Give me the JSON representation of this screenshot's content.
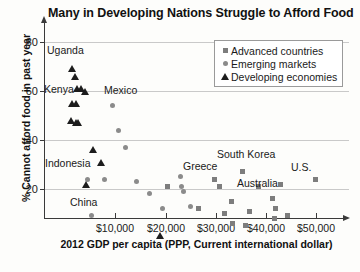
{
  "chart_data": {
    "type": "scatter",
    "title": "Many in Developing Nations Struggle to Afford Food",
    "xlabel": "2012 GDP per capita (PPP, Current international dollar)",
    "ylabel": "% Cannot afford food in past year",
    "xlim": [
      0,
      54000
    ],
    "ylim": [
      0,
      84
    ],
    "grid": true,
    "legend_position": "top-right",
    "xticks": [
      10000,
      20000,
      30000,
      40000,
      50000
    ],
    "xtick_labels": [
      "$10,000",
      "$20,000",
      "$30,000",
      "$40,000",
      "$50,000"
    ],
    "yticks": [
      20,
      40,
      60,
      80
    ],
    "ytick_labels": [
      "20",
      "40",
      "60",
      "80"
    ],
    "series": [
      {
        "name": "Advanced countries",
        "marker": "square",
        "color": "#7d7d7d",
        "points": [
          {
            "x": 20400,
            "y": 21
          },
          {
            "x": 26700,
            "y": 12
          },
          {
            "x": 29800,
            "y": 24
          },
          {
            "x": 30900,
            "y": 21
          },
          {
            "x": 31900,
            "y": 10
          },
          {
            "x": 33300,
            "y": 15
          },
          {
            "x": 33400,
            "y": 6
          },
          {
            "x": 35500,
            "y": 27
          },
          {
            "x": 36100,
            "y": 5
          },
          {
            "x": 36800,
            "y": 11
          },
          {
            "x": 38700,
            "y": 21
          },
          {
            "x": 41400,
            "y": 16
          },
          {
            "x": 41900,
            "y": 8
          },
          {
            "x": 42100,
            "y": 12
          },
          {
            "x": 43000,
            "y": 22
          },
          {
            "x": 44500,
            "y": 9
          },
          {
            "x": 50000,
            "y": 24
          }
        ]
      },
      {
        "name": "Emerging markets",
        "marker": "circle",
        "color": "#8b8b8b",
        "points": [
          {
            "x": 4500,
            "y": 24
          },
          {
            "x": 5200,
            "y": 9
          },
          {
            "x": 7800,
            "y": 24
          },
          {
            "x": 9400,
            "y": 54
          },
          {
            "x": 10600,
            "y": 44
          },
          {
            "x": 12100,
            "y": 37
          },
          {
            "x": 14300,
            "y": 23
          },
          {
            "x": 16800,
            "y": 18
          },
          {
            "x": 19400,
            "y": 12
          },
          {
            "x": 23100,
            "y": 25
          },
          {
            "x": 23300,
            "y": 21
          },
          {
            "x": 23600,
            "y": 19
          },
          {
            "x": 25100,
            "y": 13
          }
        ]
      },
      {
        "name": "Developing economies",
        "marker": "triangle",
        "color": "#1c1c1c",
        "points": [
          {
            "x": 1400,
            "y": 69
          },
          {
            "x": 2000,
            "y": 66
          },
          {
            "x": 2400,
            "y": 61
          },
          {
            "x": 3100,
            "y": 61
          },
          {
            "x": 4000,
            "y": 60
          },
          {
            "x": 1300,
            "y": 55
          },
          {
            "x": 2200,
            "y": 55
          },
          {
            "x": 1200,
            "y": 48
          },
          {
            "x": 2100,
            "y": 47
          },
          {
            "x": 2600,
            "y": 47
          },
          {
            "x": 5500,
            "y": 36
          },
          {
            "x": 7100,
            "y": 31
          },
          {
            "x": 4100,
            "y": 22
          },
          {
            "x": 19000,
            "y": 1
          }
        ]
      }
    ],
    "annotations": [
      {
        "label": "Uganda",
        "x_px": 47,
        "y_px": 44
      },
      {
        "label": "Kenya",
        "x_px": 44,
        "y_px": 83
      },
      {
        "label": "Mexico",
        "x_px": 104,
        "y_px": 84
      },
      {
        "label": "Indonesia",
        "x_px": 45,
        "y_px": 157
      },
      {
        "label": "China",
        "x_px": 70,
        "y_px": 196
      },
      {
        "label": "Greece",
        "x_px": 183,
        "y_px": 160
      },
      {
        "label": "South Korea",
        "x_px": 217,
        "y_px": 148
      },
      {
        "label": "Australia",
        "x_px": 237,
        "y_px": 177
      },
      {
        "label": "U.S.",
        "x_px": 291,
        "y_px": 161
      }
    ]
  }
}
